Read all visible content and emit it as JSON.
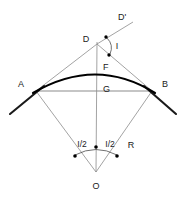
{
  "figure": {
    "type": "geometry-diagram",
    "background_color": "#ffffff",
    "colors": {
      "arc": "#000000",
      "tangent": "#1a1a1a",
      "construction": "#8c8c8c",
      "chord": "#8c8c8c",
      "label": "#1a1a1a",
      "marker_dot": "#000000"
    }
  },
  "labels": {
    "d_prime": "D'",
    "d": "D",
    "i_angle": "I",
    "f": "F",
    "g": "G",
    "a": "A",
    "b": "B",
    "r": "R",
    "i_half_left": "I/2",
    "i_half_right": "I/2",
    "o": "O"
  },
  "geometry": {
    "point_o": {
      "x": 96,
      "y": 172
    },
    "point_d": {
      "x": 97,
      "y": 44
    },
    "point_f": {
      "x": 97,
      "y": 69
    },
    "point_g": {
      "x": 97,
      "y": 93
    },
    "point_a": {
      "x": 36,
      "y": 91
    },
    "point_b": {
      "x": 152,
      "y": 91
    },
    "d_prime_end": {
      "x": 133,
      "y": 22
    },
    "tangent_left_end": {
      "x": 10,
      "y": 114
    },
    "tangent_right_end": {
      "x": 176,
      "y": 114
    },
    "center_line_top": {
      "x": 97,
      "y": 44
    },
    "center_line_bottom": {
      "x": 96,
      "y": 172
    }
  },
  "markers": {
    "angle_i_arc": "arc between line DD' and line DB at vertex D",
    "angle_i_dots": 2,
    "angle_half_arc": "arc spanning the two radii at vertex O",
    "angle_half_dots": 3
  }
}
